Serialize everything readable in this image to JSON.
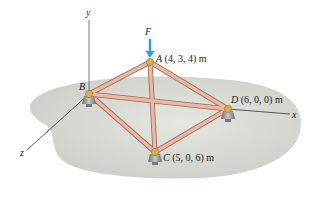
{
  "figure": {
    "axes": {
      "x_label": "x",
      "y_label": "y",
      "z_label": "z"
    },
    "force": {
      "label": "F",
      "color": "#2a9fd8",
      "direction": "downward"
    },
    "joints": [
      {
        "name": "A",
        "coords": "(4, 3, 4) m"
      },
      {
        "name": "B",
        "coords": ""
      },
      {
        "name": "C",
        "coords": "(5, 0, 6) m"
      },
      {
        "name": "D",
        "coords": "(6, 0, 0) m"
      }
    ],
    "members": [
      "AB",
      "AC",
      "AD",
      "BC",
      "BD",
      "CD"
    ],
    "colors": {
      "member": "#e8b5a3",
      "member_edge": "#9a6a5a",
      "joint": "#d9b24a",
      "ground": "#dcdcd6",
      "support": "#9a9a9a"
    }
  }
}
